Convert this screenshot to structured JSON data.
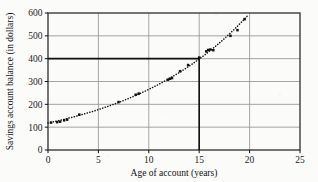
{
  "chart_data": {
    "type": "scatter",
    "title": "",
    "xlabel": "Age of account (years)",
    "ylabel": "Savings account balance (in dollars)",
    "xlim": [
      0,
      25
    ],
    "ylim": [
      0,
      600
    ],
    "xticks": [
      0,
      5,
      10,
      15,
      20,
      25
    ],
    "yticks": [
      0,
      100,
      200,
      300,
      400,
      500,
      600
    ],
    "grid": true,
    "legend": "none",
    "series": [
      {
        "name": "Savings account balance",
        "marker": "filled-square",
        "points": [
          [
            0.3,
            120
          ],
          [
            0.9,
            122
          ],
          [
            1.2,
            124
          ],
          [
            1.6,
            130
          ],
          [
            1.9,
            133
          ],
          [
            3.1,
            155
          ],
          [
            7.0,
            210
          ],
          [
            8.7,
            242
          ],
          [
            9.0,
            247
          ],
          [
            11.9,
            308
          ],
          [
            12.1,
            312
          ],
          [
            12.3,
            315
          ],
          [
            13.1,
            345
          ],
          [
            13.9,
            372
          ],
          [
            15.0,
            405
          ],
          [
            15.7,
            432
          ],
          [
            15.9,
            438
          ],
          [
            16.1,
            440
          ],
          [
            16.4,
            437
          ],
          [
            18.1,
            500
          ],
          [
            18.8,
            525
          ],
          [
            19.5,
            573
          ]
        ]
      }
    ],
    "trend": {
      "name": "exponential-trend-curve",
      "style": "dotted",
      "description": "dotted exponential curve through the data points"
    },
    "reference_lines": [
      {
        "name": "horizontal-reference-line",
        "axis": "y",
        "value": 400
      },
      {
        "name": "vertical-reference-line",
        "axis": "x",
        "value": 15
      }
    ],
    "intersection": {
      "x": 15,
      "y": 400
    }
  },
  "axes": {
    "x_ticks": [
      "0",
      "5",
      "10",
      "15",
      "20",
      "25"
    ],
    "y_ticks": [
      "0",
      "100",
      "200",
      "300",
      "400",
      "500",
      "600"
    ],
    "x_title": "Age of account (years)",
    "y_title": "Savings account balance (in dollars)"
  },
  "colors": {
    "ink": "#121212",
    "grid": "#9a9a9a",
    "frame": "#3c3c3c",
    "reference": "#101010",
    "background": "#fbfbfa"
  }
}
